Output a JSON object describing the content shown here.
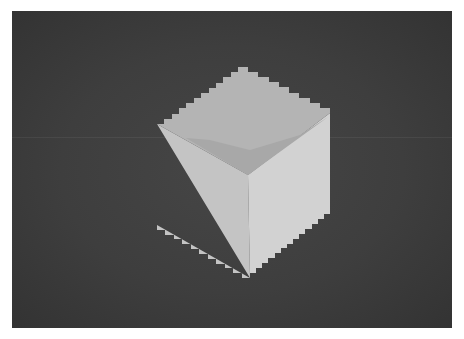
{
  "image": {
    "subject": "pixelated shaded 3D cube on dark background",
    "background_color": "#3e3e3e",
    "frame": {
      "x": 12,
      "y": 11,
      "width": 440,
      "height": 317
    },
    "cube": {
      "step_px": 5,
      "faces": {
        "top": {
          "color": "#b4b4b4"
        },
        "top_shadow": {
          "color": "#a8a8a8"
        },
        "left": {
          "color": "#c4c4c4"
        },
        "right": {
          "color": "#d2d2d2"
        }
      },
      "vertices": {
        "top": [
          238,
          67
        ],
        "left_top": [
          157,
          124
        ],
        "right_top": [
          330,
          113
        ],
        "center": [
          248,
          175
        ],
        "left_bottom": [
          157,
          225
        ],
        "right_bottom": [
          330,
          214
        ],
        "bottom": [
          250,
          278
        ]
      }
    }
  }
}
